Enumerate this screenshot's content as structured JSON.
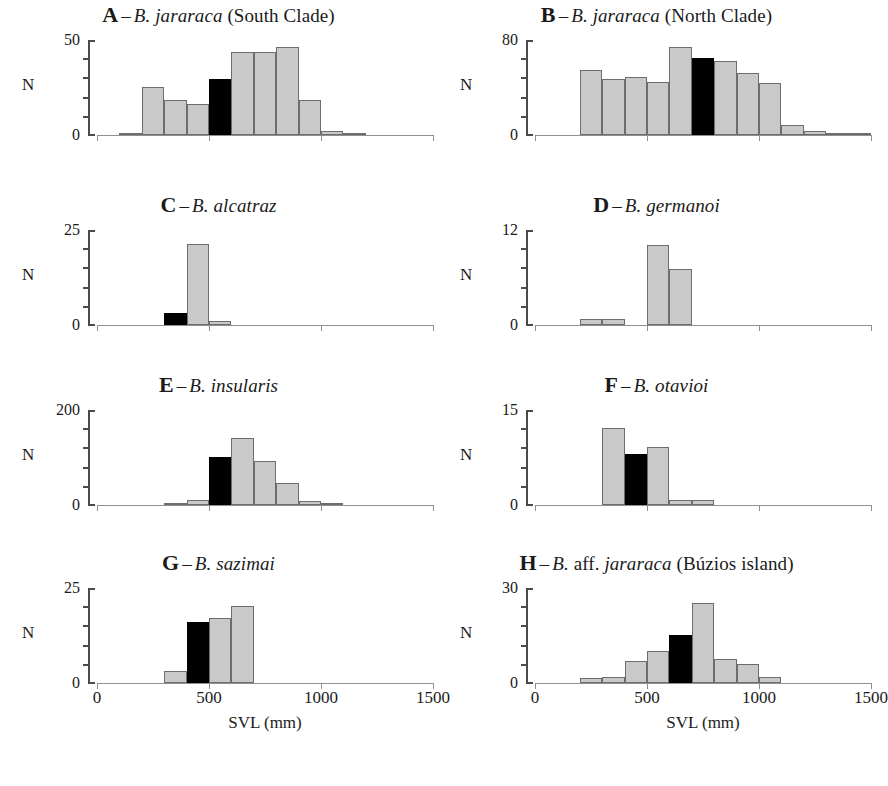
{
  "figure": {
    "axis": {
      "x_title": "SVL (mm)",
      "x_ticks": [
        0,
        500,
        1000,
        1500
      ],
      "x_tick_labels": [
        "0",
        "500",
        "1000",
        "1500"
      ],
      "x_min": 0,
      "x_max": 1500,
      "y_axis_label": "N",
      "y_min": 0,
      "y_tick_count": 5
    },
    "legend": {
      "grey_swatch": "#c9c9c9",
      "black_swatch": "#000000",
      "grey_meaning": "size class bars",
      "black_meaning": "highlighted size class"
    }
  },
  "chart_data": [
    {
      "type": "bar",
      "panel": "A",
      "letter": "A",
      "dash": "–",
      "title_italic": "B. jararaca",
      "title_roman": " (South Clade)",
      "title": "A – B. jararaca (South Clade)",
      "xlabel": "SVL (mm)",
      "ylabel": "N",
      "ylim": [
        0,
        50
      ],
      "ytick_labels": [
        "0",
        "50"
      ],
      "xlim": [
        0,
        1500
      ],
      "bin_width": 100,
      "bin_starts": [
        100,
        200,
        300,
        400,
        500,
        600,
        700,
        800,
        900,
        1000,
        1100
      ],
      "values": [
        0.6,
        25,
        18,
        16,
        29,
        43,
        43,
        46,
        18,
        2,
        0.6
      ],
      "highlight_index": 4,
      "highlight_color": "#000000",
      "bar_color": "#c9c9c9"
    },
    {
      "type": "bar",
      "panel": "B",
      "letter": "B",
      "dash": "–",
      "title_italic": "B. jararaca",
      "title_roman": " (North Clade)",
      "title": "B – B. jararaca (North Clade)",
      "xlabel": "SVL (mm)",
      "ylabel": "N",
      "ylim": [
        0,
        80
      ],
      "ytick_labels": [
        "0",
        "80"
      ],
      "xlim": [
        0,
        1500
      ],
      "bin_width": 100,
      "bin_starts": [
        200,
        300,
        400,
        500,
        600,
        700,
        800,
        900,
        1000,
        1100,
        1200,
        1300,
        1400
      ],
      "values": [
        54,
        47,
        48,
        44,
        73,
        64,
        62,
        52,
        43,
        8,
        3,
        1,
        1.5
      ],
      "highlight_index": 5,
      "highlight_color": "#000000",
      "bar_color": "#c9c9c9"
    },
    {
      "type": "bar",
      "panel": "C",
      "letter": "C",
      "dash": "–",
      "title_italic": "B. alcatraz",
      "title_roman": "",
      "title": "C – B. alcatraz",
      "xlabel": "SVL (mm)",
      "ylabel": "N",
      "ylim": [
        0,
        25
      ],
      "ytick_labels": [
        "0",
        "25"
      ],
      "xlim": [
        0,
        1500
      ],
      "bin_width": 100,
      "bin_starts": [
        300,
        400,
        500
      ],
      "values": [
        3,
        21,
        1
      ],
      "highlight_index": 0,
      "highlight_color": "#000000",
      "bar_color": "#c9c9c9"
    },
    {
      "type": "bar",
      "panel": "D",
      "letter": "D",
      "dash": "–",
      "title_italic": "B. germanoi",
      "title_roman": "",
      "title": "D – B. germanoi",
      "xlabel": "SVL (mm)",
      "ylabel": "N",
      "ylim": [
        0,
        12
      ],
      "ytick_labels": [
        "0",
        "12"
      ],
      "xlim": [
        0,
        1500
      ],
      "bin_width": 100,
      "bin_starts": [
        200,
        300,
        500,
        600
      ],
      "values": [
        0.8,
        0.8,
        10,
        7
      ],
      "highlight_index": -1,
      "highlight_color": "#000000",
      "bar_color": "#c9c9c9"
    },
    {
      "type": "bar",
      "panel": "E",
      "letter": "E",
      "dash": "–",
      "title_italic": "B. insularis",
      "title_roman": "",
      "title": "E – B. insularis",
      "xlabel": "SVL (mm)",
      "ylabel": "N",
      "ylim": [
        0,
        200
      ],
      "ytick_labels": [
        "0",
        "200"
      ],
      "xlim": [
        0,
        1500
      ],
      "bin_width": 100,
      "bin_starts": [
        300,
        400,
        500,
        600,
        700,
        800,
        900,
        1000
      ],
      "values": [
        4,
        10,
        100,
        140,
        92,
        45,
        8,
        2
      ],
      "highlight_index": 2,
      "highlight_color": "#000000",
      "bar_color": "#c9c9c9"
    },
    {
      "type": "bar",
      "panel": "F",
      "letter": "F",
      "dash": "–",
      "title_italic": "B. otavioi",
      "title_roman": "",
      "title": "F – B. otavioi",
      "xlabel": "SVL (mm)",
      "ylabel": "N",
      "ylim": [
        0,
        15
      ],
      "ytick_labels": [
        "0",
        "15"
      ],
      "xlim": [
        0,
        1500
      ],
      "bin_width": 100,
      "bin_starts": [
        300,
        400,
        500,
        600,
        700
      ],
      "values": [
        12,
        8,
        9,
        0.8,
        0.8
      ],
      "highlight_index": 1,
      "highlight_color": "#000000",
      "bar_color": "#c9c9c9"
    },
    {
      "type": "bar",
      "panel": "G",
      "letter": "G",
      "dash": "–",
      "title_italic": "B. sazimai",
      "title_roman": "",
      "title": "G – B. sazimai",
      "xlabel": "SVL (mm)",
      "ylabel": "N",
      "ylim": [
        0,
        25
      ],
      "ytick_labels": [
        "0",
        "25"
      ],
      "xlim": [
        0,
        1500
      ],
      "bin_width": 100,
      "bin_starts": [
        300,
        400,
        500,
        600
      ],
      "values": [
        3,
        16,
        17,
        20
      ],
      "highlight_index": 1,
      "highlight_color": "#000000",
      "bar_color": "#c9c9c9"
    },
    {
      "type": "bar",
      "panel": "H",
      "letter": "H",
      "dash": "–",
      "title_italic": "jararaca",
      "title_roman_pre": "B. ",
      "title_roman_mid": "aff. ",
      "title_roman": " (Búzios island)",
      "title": "H – B. aff. jararaca (Búzios island)",
      "xlabel": "SVL (mm)",
      "ylabel": "N",
      "ylim": [
        0,
        30
      ],
      "ytick_labels": [
        "0",
        "30"
      ],
      "xlim": [
        0,
        1500
      ],
      "bin_width": 100,
      "bin_starts": [
        200,
        300,
        400,
        500,
        600,
        700,
        800,
        900,
        1000
      ],
      "values": [
        1.5,
        2,
        7,
        10,
        15,
        25,
        7.5,
        6,
        2
      ],
      "highlight_index": 4,
      "highlight_color": "#000000",
      "bar_color": "#c9c9c9"
    }
  ]
}
